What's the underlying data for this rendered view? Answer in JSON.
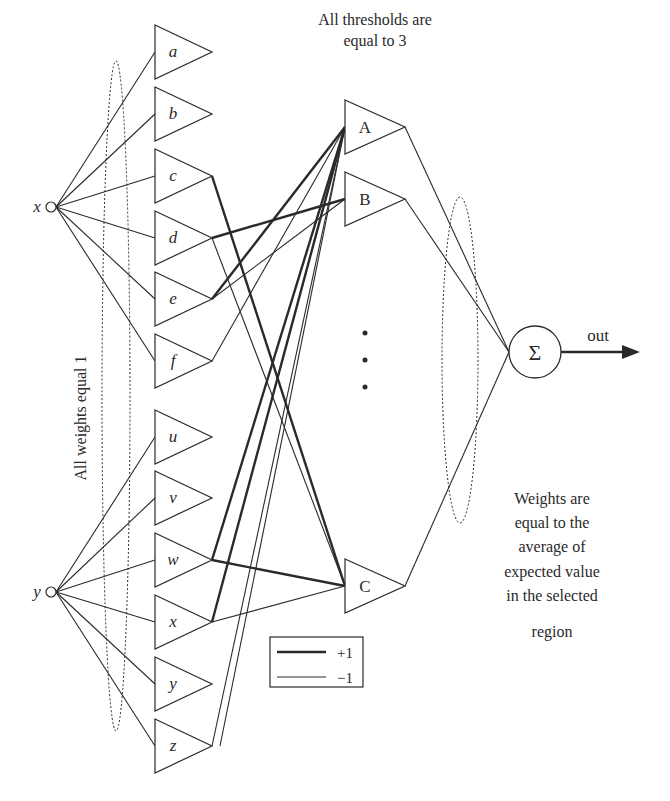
{
  "diagram": {
    "inputs": [
      {
        "id": "x",
        "label": "x",
        "cx": 51,
        "cy": 207
      },
      {
        "id": "y",
        "label": "y",
        "cx": 51,
        "cy": 592
      }
    ],
    "layer1": {
      "left": 155,
      "tip": 212,
      "half_height": 27,
      "nodes": [
        {
          "label": "a",
          "cy": 52,
          "input": "x"
        },
        {
          "label": "b",
          "cy": 114,
          "input": "x"
        },
        {
          "label": "c",
          "cy": 176,
          "input": "x"
        },
        {
          "label": "d",
          "cy": 238,
          "input": "x"
        },
        {
          "label": "e",
          "cy": 299,
          "input": "x"
        },
        {
          "label": "f",
          "cy": 361,
          "input": "x"
        },
        {
          "label": "u",
          "cy": 437,
          "input": "y"
        },
        {
          "label": "v",
          "cy": 498,
          "input": "y"
        },
        {
          "label": "w",
          "cy": 560,
          "input": "y"
        },
        {
          "label": "x",
          "cy": 622,
          "input": "y"
        },
        {
          "label": "y",
          "cy": 684,
          "input": "y"
        },
        {
          "label": "z",
          "cy": 746,
          "input": "y"
        }
      ]
    },
    "layer2": {
      "left": 345,
      "tip": 405,
      "half_height": 27,
      "nodes": [
        {
          "label": "A",
          "cy": 127
        },
        {
          "label": "B",
          "cy": 199
        },
        {
          "label": "C",
          "cy": 586
        }
      ],
      "ellipsis": "⋮"
    },
    "connections": [
      {
        "from": "c",
        "to": "C",
        "weight": "+1"
      },
      {
        "from": "d",
        "to": "B",
        "weight": "+1"
      },
      {
        "from": "d",
        "to": "C",
        "weight": "-1"
      },
      {
        "from": "e",
        "to": "A",
        "weight": "+1"
      },
      {
        "from": "e",
        "to": "B",
        "weight": "-1"
      },
      {
        "from": "f",
        "to": "A",
        "weight": "-1"
      },
      {
        "from": "w",
        "to": "A",
        "weight": "+1"
      },
      {
        "from": "w",
        "to": "C",
        "weight": "+1"
      },
      {
        "from": "x",
        "to": "A",
        "weight": "+1"
      },
      {
        "from": "x",
        "to": "C",
        "weight": "-1"
      },
      {
        "from": "z",
        "to": "A",
        "weight": "-1"
      },
      {
        "from": "z",
        "to": "A",
        "weight": "-1",
        "offset": 8
      }
    ],
    "sum_node": {
      "label": "Σ",
      "cx": 535,
      "cy": 352,
      "r": 26
    },
    "output": {
      "label": "out"
    },
    "annotations": {
      "thresholds_line1": "All thresholds are",
      "thresholds_line2": "equal to 3",
      "weights_equal": "All weights equal 1",
      "weights_avg": [
        "Weights are",
        "equal to the",
        "average of",
        "expected value",
        "in the selected",
        "region"
      ]
    },
    "legend": {
      "items": [
        {
          "label": "+1",
          "style": "thick"
        },
        {
          "label": "−1",
          "style": "thin"
        }
      ]
    },
    "colors": {
      "stroke": "#2a2a2a",
      "background": "#ffffff"
    }
  }
}
